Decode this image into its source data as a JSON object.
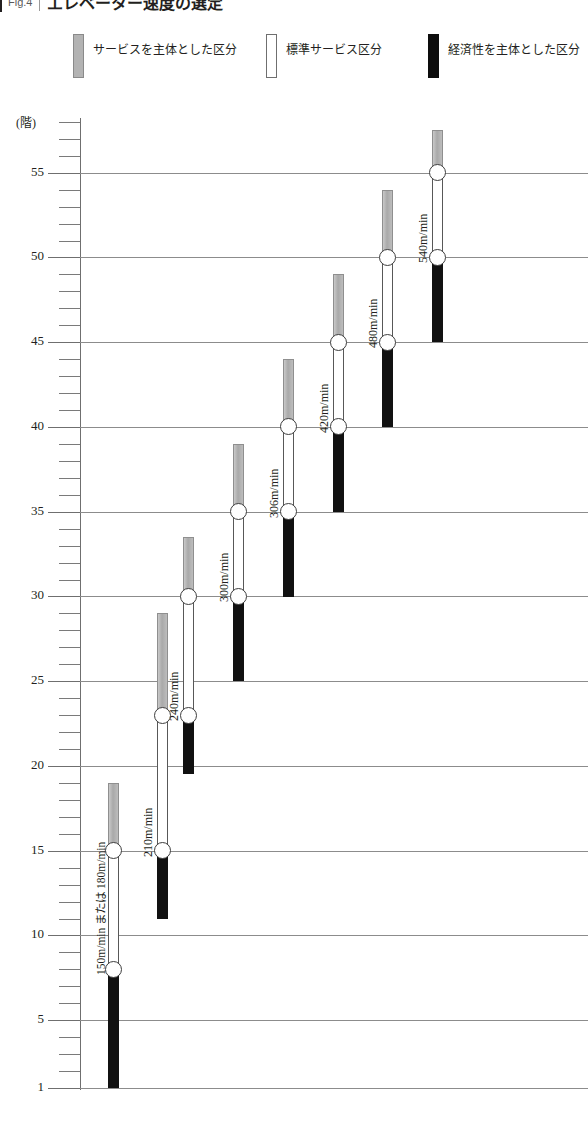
{
  "header": {
    "figure_number": "Fig.4",
    "title": "エレベーター速度の選定",
    "divider_icon": "vertical-rule"
  },
  "legend": {
    "items": [
      {
        "label": "サービスを主体とした区分",
        "swatch": "gray",
        "color": "#b3b3b3",
        "x": 73
      },
      {
        "label": "標準サービス区分",
        "swatch": "white",
        "color": "#ffffff",
        "x": 266
      },
      {
        "label": "経済性を主体とした区分",
        "swatch": "black",
        "color": "#0d0d0d",
        "x": 428
      }
    ]
  },
  "axis": {
    "unit_label": "(階)",
    "major_ticks": [
      55,
      50,
      45,
      40,
      35,
      30,
      25,
      20,
      15,
      10,
      5,
      1
    ],
    "minor_tick_step": 1,
    "min": 1,
    "max": 58
  },
  "chart_data": {
    "type": "bar",
    "title": "エレベーター速度の選定",
    "xlabel": "",
    "ylabel": "(階)",
    "ylim": [
      1,
      58
    ],
    "grid": true,
    "legend_position": "top",
    "series": [
      {
        "name": "経済性を主体とした区分",
        "color": "#111111"
      },
      {
        "name": "標準サービス区分",
        "color": "#ffffff"
      },
      {
        "name": "サービスを主体とした区分",
        "color": "#b3b3b3"
      }
    ],
    "categories": [
      "150m/min または 180m/min",
      "210m/min",
      "240m/min",
      "300m/min",
      "306m/min",
      "420m/min",
      "480m/min",
      "540m/min"
    ],
    "bars": [
      {
        "label": "150m/min または 180m/min",
        "economy": [
          1,
          8
        ],
        "standard": [
          8,
          15
        ],
        "service": [
          15,
          19
        ],
        "nodes": [
          8,
          15
        ]
      },
      {
        "label": "210m/min",
        "economy": [
          11,
          15
        ],
        "standard": [
          15,
          23
        ],
        "service": [
          23,
          29
        ],
        "nodes": [
          15,
          23
        ]
      },
      {
        "label": "240m/min",
        "economy": [
          19.5,
          23
        ],
        "standard": [
          23,
          30
        ],
        "service": [
          30,
          33.5
        ],
        "nodes": [
          23,
          30
        ]
      },
      {
        "label": "300m/min",
        "economy": [
          25,
          30
        ],
        "standard": [
          30,
          35
        ],
        "service": [
          35,
          39
        ],
        "nodes": [
          30,
          35
        ]
      },
      {
        "label": "306m/min",
        "economy": [
          30,
          35
        ],
        "standard": [
          35,
          40
        ],
        "service": [
          40,
          44
        ],
        "nodes": [
          35,
          40
        ]
      },
      {
        "label": "420m/min",
        "economy": [
          35,
          40
        ],
        "standard": [
          40,
          45
        ],
        "service": [
          45,
          49
        ],
        "nodes": [
          40,
          45
        ]
      },
      {
        "label": "480m/min",
        "economy": [
          40,
          45
        ],
        "standard": [
          45,
          50
        ],
        "service": [
          50,
          54
        ],
        "nodes": [
          45,
          50
        ]
      },
      {
        "label": "540m/min",
        "economy": [
          45,
          50
        ],
        "standard": [
          50,
          55
        ],
        "service": [
          55,
          57.5
        ],
        "nodes": [
          50,
          55
        ]
      }
    ]
  },
  "geometry": {
    "axis_x": 80,
    "plot_right": 588,
    "floor1_y": 1088,
    "px_per_floor": 16.95,
    "bar_width": 11,
    "node_diameter": 17,
    "group_x": [
      113,
      162,
      188,
      238,
      288,
      338,
      387,
      437
    ],
    "label_dx": -16
  }
}
